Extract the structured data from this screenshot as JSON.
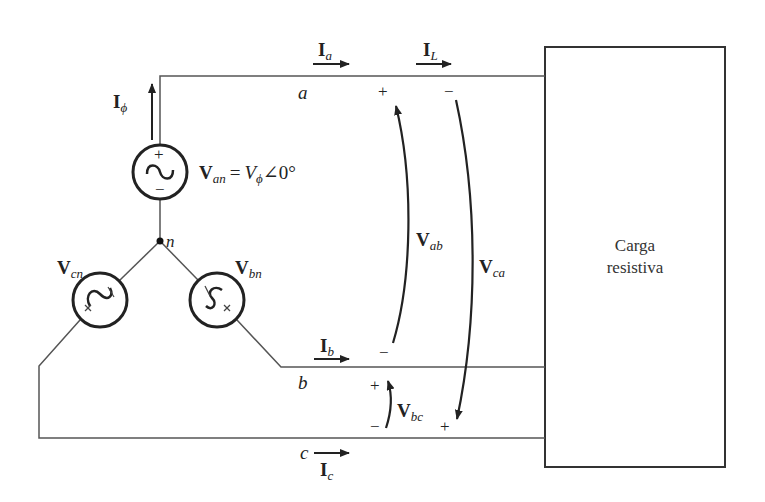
{
  "diagram": {
    "type": "three-phase Y-connected source with resistive load",
    "colors": {
      "line": "#555555",
      "ink": "#222222",
      "background": "#ffffff"
    },
    "load": {
      "line1": "Carga",
      "line2": "resistiva"
    },
    "nodes": {
      "neutral": "n",
      "line_a": "a",
      "line_b": "b",
      "line_c": "c"
    },
    "sources": {
      "an": {
        "symbol": "V",
        "sub": "an",
        "equation_rhs_symbol": "V",
        "equation_rhs_sub": "ϕ",
        "equation_rhs_angle": "∠0°",
        "equals": "=",
        "plus": "+",
        "minus": "−"
      },
      "bn": {
        "symbol": "V",
        "sub": "bn"
      },
      "cn": {
        "symbol": "V",
        "sub": "cn"
      }
    },
    "currents": {
      "phase": {
        "symbol": "I",
        "sub": "ϕ"
      },
      "a": {
        "symbol": "I",
        "sub": "a"
      },
      "L": {
        "symbol": "I",
        "sub": "L"
      },
      "b": {
        "symbol": "I",
        "sub": "b"
      },
      "c": {
        "symbol": "I",
        "sub": "c"
      }
    },
    "voltages": {
      "ab": {
        "symbol": "V",
        "sub": "ab",
        "plus": "+",
        "minus": "−"
      },
      "ca": {
        "symbol": "V",
        "sub": "ca",
        "plus": "+",
        "minus": "−"
      },
      "bc": {
        "symbol": "V",
        "sub": "bc",
        "plus": "+",
        "minus": "−"
      }
    }
  }
}
